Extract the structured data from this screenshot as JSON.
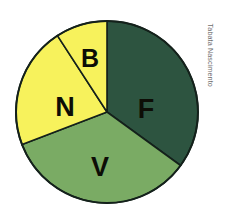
{
  "figure": {
    "credit": "Tabata Nascimento",
    "background_color": "#ffffff",
    "outline_color": "#14211b"
  },
  "chart_data": {
    "type": "pie",
    "title": "",
    "xlabel": "",
    "ylabel": "",
    "legend": "none",
    "grid": false,
    "center_px": [
      107,
      112
    ],
    "radius_px": 91,
    "start_angle_deg": 0,
    "direction": "clockwise",
    "categories": [
      "F",
      "V",
      "N",
      "B"
    ],
    "values": [
      126,
      123,
      78,
      33
    ],
    "units": "degrees",
    "percentages": [
      35,
      34.2,
      21.7,
      9.2
    ],
    "colors": [
      "#2d5440",
      "#7aab64",
      "#f7f25c",
      "#f7f25c"
    ],
    "slices": [
      {
        "label": "F",
        "value": 126,
        "percent": 35,
        "color": "#2d5440",
        "start_deg": 0,
        "end_deg": 126,
        "label_x": 146,
        "label_y": 109,
        "label_size": 27
      },
      {
        "label": "V",
        "value": 123,
        "percent": 34.2,
        "color": "#7aab64",
        "start_deg": 126,
        "end_deg": 249,
        "label_x": 100,
        "label_y": 167,
        "label_size": 27
      },
      {
        "label": "N",
        "value": 78,
        "percent": 21.7,
        "color": "#f7f25c",
        "start_deg": 249,
        "end_deg": 327,
        "label_x": 65,
        "label_y": 107,
        "label_size": 27
      },
      {
        "label": "B",
        "value": 33,
        "percent": 9.2,
        "color": "#f7f25c",
        "start_deg": 327,
        "end_deg": 360,
        "label_x": 90,
        "label_y": 58,
        "label_size": 25
      }
    ]
  }
}
